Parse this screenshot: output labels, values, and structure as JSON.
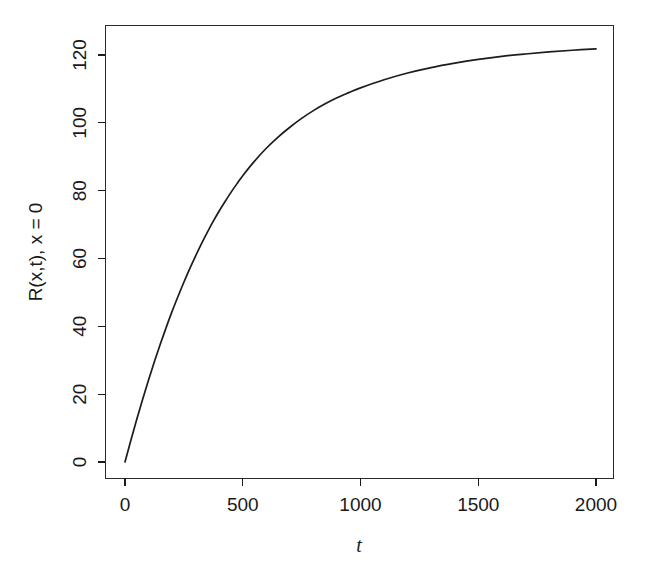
{
  "figure": {
    "background_color": "#ffffff",
    "line_color": "#1c1c1c",
    "axis_color": "#1a1a1a"
  },
  "chart_data": {
    "type": "line",
    "title": "",
    "subtitle": "",
    "xlabel": "t",
    "ylabel": "R(x,t), x = 0",
    "xlim": [
      -60,
      2060
    ],
    "ylim": [
      -5,
      128
    ],
    "grid": false,
    "legend": null,
    "xticks": [
      0,
      500,
      1000,
      1500,
      2000
    ],
    "xtick_labels": [
      "0",
      "500",
      "1000",
      "1500",
      "2000"
    ],
    "yticks": [
      0,
      20,
      40,
      60,
      80,
      100,
      120
    ],
    "ytick_labels": [
      "0",
      "20",
      "40",
      "60",
      "80",
      "100",
      "120"
    ],
    "series": [
      {
        "name": "R(x,t) at x = 0",
        "x": [
          0,
          25,
          50,
          75,
          100,
          125,
          150,
          175,
          200,
          225,
          250,
          275,
          300,
          325,
          350,
          375,
          400,
          425,
          450,
          475,
          500,
          550,
          600,
          650,
          700,
          750,
          800,
          850,
          900,
          950,
          1000,
          1100,
          1200,
          1300,
          1400,
          1500,
          1600,
          1700,
          1800,
          1900,
          2000
        ],
        "y": [
          0.0,
          6.4,
          12.6,
          18.5,
          24.2,
          29.6,
          34.8,
          39.7,
          44.4,
          48.8,
          53.0,
          57.0,
          60.8,
          64.4,
          67.8,
          71.0,
          74.0,
          76.8,
          79.5,
          82.0,
          84.4,
          88.7,
          92.5,
          95.8,
          98.7,
          101.3,
          103.6,
          105.6,
          107.4,
          108.9,
          110.3,
          112.7,
          114.7,
          116.3,
          117.6,
          118.7,
          119.6,
          120.3,
          120.9,
          121.4,
          121.8
        ]
      }
    ],
    "annotations": []
  }
}
